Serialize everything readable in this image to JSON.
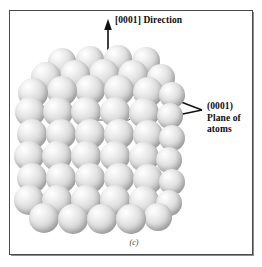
{
  "figure": {
    "caption": "(c)",
    "type": "crystal-structure-diagram",
    "structure": "hexagonal close-packed sphere model",
    "background_color": "#ffffff",
    "frame_color": "#4a4a4a"
  },
  "annotations": {
    "direction": {
      "label": "[0001]  Direction",
      "miller_index": "[0001]",
      "word": "Direction",
      "arrow": "vertical-up-arrow"
    },
    "plane": {
      "line1": "(0001)",
      "line2": "Plane of",
      "line3": "atoms",
      "miller_index": "(0001)",
      "arrow": "two-branch-leader-arrow"
    }
  },
  "atom_model": {
    "sphere_fill": "#dcdcdc",
    "sphere_highlight": "#ffffff",
    "sphere_shadow": "#9a9a9a",
    "hexagon_outline_color": "#4e4e4e",
    "atom_count": 58
  },
  "chart_data": {
    "type": "scatter",
    "xlabel": "",
    "ylabel": "",
    "legend": [],
    "annotations": [
      "[0001]  Direction",
      "(0001) Plane of atoms",
      "(c)"
    ],
    "spheres": [
      {
        "x": 62,
        "y": 62,
        "r": 14,
        "layer": "top"
      },
      {
        "x": 90,
        "y": 60,
        "r": 14,
        "layer": "top"
      },
      {
        "x": 118,
        "y": 59,
        "r": 14,
        "layer": "top"
      },
      {
        "x": 146,
        "y": 61,
        "r": 14,
        "layer": "top"
      },
      {
        "x": 46,
        "y": 77,
        "r": 15,
        "layer": "top"
      },
      {
        "x": 75,
        "y": 75,
        "r": 15,
        "layer": "top"
      },
      {
        "x": 104,
        "y": 74,
        "r": 15,
        "layer": "top"
      },
      {
        "x": 133,
        "y": 75,
        "r": 15,
        "layer": "top"
      },
      {
        "x": 161,
        "y": 78,
        "r": 14,
        "layer": "top"
      },
      {
        "x": 33,
        "y": 93,
        "r": 15,
        "layer": "top"
      },
      {
        "x": 62,
        "y": 91,
        "r": 15,
        "layer": "top"
      },
      {
        "x": 90,
        "y": 90,
        "r": 15,
        "layer": "top"
      },
      {
        "x": 119,
        "y": 90,
        "r": 15,
        "layer": "top"
      },
      {
        "x": 148,
        "y": 92,
        "r": 15,
        "layer": "top"
      },
      {
        "x": 172,
        "y": 95,
        "r": 13,
        "layer": "top"
      },
      {
        "x": 30,
        "y": 112,
        "r": 15,
        "layer": "mid"
      },
      {
        "x": 58,
        "y": 112,
        "r": 15,
        "layer": "mid"
      },
      {
        "x": 86,
        "y": 112,
        "r": 15,
        "layer": "mid"
      },
      {
        "x": 115,
        "y": 112,
        "r": 15,
        "layer": "mid"
      },
      {
        "x": 144,
        "y": 113,
        "r": 15,
        "layer": "mid"
      },
      {
        "x": 170,
        "y": 116,
        "r": 13,
        "layer": "mid"
      },
      {
        "x": 32,
        "y": 134,
        "r": 15,
        "layer": "mid"
      },
      {
        "x": 61,
        "y": 134,
        "r": 15,
        "layer": "mid"
      },
      {
        "x": 90,
        "y": 134,
        "r": 15,
        "layer": "mid"
      },
      {
        "x": 119,
        "y": 134,
        "r": 15,
        "layer": "mid"
      },
      {
        "x": 148,
        "y": 135,
        "r": 15,
        "layer": "mid"
      },
      {
        "x": 172,
        "y": 138,
        "r": 13,
        "layer": "mid"
      },
      {
        "x": 29,
        "y": 156,
        "r": 15,
        "layer": "mid"
      },
      {
        "x": 57,
        "y": 156,
        "r": 15,
        "layer": "mid"
      },
      {
        "x": 86,
        "y": 156,
        "r": 15,
        "layer": "mid"
      },
      {
        "x": 115,
        "y": 156,
        "r": 15,
        "layer": "mid"
      },
      {
        "x": 144,
        "y": 157,
        "r": 15,
        "layer": "mid"
      },
      {
        "x": 169,
        "y": 160,
        "r": 13,
        "layer": "mid"
      },
      {
        "x": 32,
        "y": 178,
        "r": 15,
        "layer": "bottom"
      },
      {
        "x": 61,
        "y": 178,
        "r": 15,
        "layer": "bottom"
      },
      {
        "x": 90,
        "y": 178,
        "r": 15,
        "layer": "bottom"
      },
      {
        "x": 119,
        "y": 178,
        "r": 15,
        "layer": "bottom"
      },
      {
        "x": 148,
        "y": 179,
        "r": 15,
        "layer": "bottom"
      },
      {
        "x": 172,
        "y": 182,
        "r": 13,
        "layer": "bottom"
      },
      {
        "x": 29,
        "y": 200,
        "r": 15,
        "layer": "bottom"
      },
      {
        "x": 57,
        "y": 200,
        "r": 15,
        "layer": "bottom"
      },
      {
        "x": 86,
        "y": 200,
        "r": 15,
        "layer": "bottom"
      },
      {
        "x": 115,
        "y": 200,
        "r": 15,
        "layer": "bottom"
      },
      {
        "x": 144,
        "y": 201,
        "r": 15,
        "layer": "bottom"
      },
      {
        "x": 169,
        "y": 203,
        "r": 13,
        "layer": "bottom"
      },
      {
        "x": 44,
        "y": 218,
        "r": 15,
        "layer": "bottom"
      },
      {
        "x": 73,
        "y": 219,
        "r": 15,
        "layer": "bottom"
      },
      {
        "x": 102,
        "y": 219,
        "r": 15,
        "layer": "bottom"
      },
      {
        "x": 131,
        "y": 219,
        "r": 15,
        "layer": "bottom"
      },
      {
        "x": 158,
        "y": 217,
        "r": 14,
        "layer": "bottom"
      }
    ]
  }
}
